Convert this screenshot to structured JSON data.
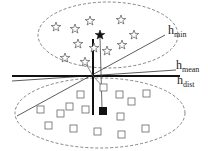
{
  "diagram": {
    "type": "hyperplane-comparison",
    "classes": [
      {
        "name": "stars",
        "marker": "star-outline",
        "count": 12,
        "region": "upper-dashed-ellipse"
      },
      {
        "name": "squares",
        "marker": "square-outline",
        "count": 16,
        "region": "lower-dashed-ellipse"
      }
    ],
    "highlighted": {
      "star": "filled-black-star",
      "square": "filled-black-square"
    },
    "lines": [
      {
        "id": "h_min",
        "base": "h",
        "sub": "min",
        "style": "thin"
      },
      {
        "id": "h_mean",
        "base": "h",
        "sub": "mean",
        "style": "thin"
      },
      {
        "id": "h_dist",
        "base": "h",
        "sub": "dist",
        "style": "thick"
      }
    ],
    "colors": {
      "line": "#111111",
      "marker_outline": "#555555",
      "ellipse": "#666666"
    }
  }
}
